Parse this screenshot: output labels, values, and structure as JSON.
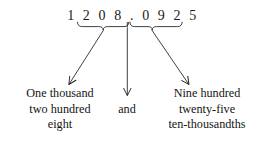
{
  "figure": {
    "background_color": "#ffffff",
    "ink_color": "#191919"
  },
  "number": {
    "full_text": "1 2 0 8 . 0 9 2 5",
    "value": "1208.0925",
    "integer_part": "1208",
    "decimal_point": ".",
    "fractional_part": "0925"
  },
  "labels": {
    "integer": {
      "lines": [
        "One thousand",
        "two hundred",
        "eight"
      ],
      "line1": "One thousand",
      "line2": "two hundred",
      "line3": "eight"
    },
    "conjunction": {
      "lines": [
        "and"
      ],
      "line1": "and"
    },
    "fraction": {
      "lines": [
        "Nine hundred",
        "twenty-five",
        "ten-thousandths"
      ],
      "line1": "Nine hundred",
      "line2": "twenty-five",
      "line3": "ten-thousandths"
    }
  },
  "connectors": [
    {
      "name": "integer-connector",
      "from": "underbrace below 1208",
      "to": "One thousand two hundred eight",
      "direction": "down-left"
    },
    {
      "name": "decimal-connector",
      "from": "decimal point",
      "to": "and",
      "direction": "down"
    },
    {
      "name": "fraction-connector",
      "from": "underbrace below 0925",
      "to": "Nine hundred twenty-five ten-thousandths",
      "direction": "down-right"
    }
  ]
}
